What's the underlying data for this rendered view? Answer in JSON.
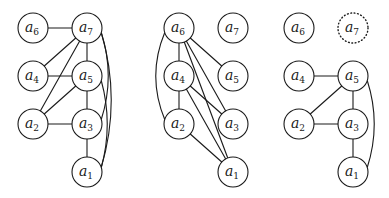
{
  "style": {
    "stroke": "#1a1a1a",
    "background": "#ffffff",
    "node_radius": 15
  },
  "panels": [
    {
      "name": "graph-left",
      "nodes": [
        {
          "id": "a6",
          "base": "a",
          "sub": "6",
          "x": 33,
          "y": 28,
          "dotted": false
        },
        {
          "id": "a7",
          "base": "a",
          "sub": "7",
          "x": 87,
          "y": 28,
          "dotted": false
        },
        {
          "id": "a4",
          "base": "a",
          "sub": "4",
          "x": 33,
          "y": 76,
          "dotted": false
        },
        {
          "id": "a5",
          "base": "a",
          "sub": "5",
          "x": 87,
          "y": 76,
          "dotted": false
        },
        {
          "id": "a2",
          "base": "a",
          "sub": "2",
          "x": 33,
          "y": 124,
          "dotted": false
        },
        {
          "id": "a3",
          "base": "a",
          "sub": "3",
          "x": 87,
          "y": 124,
          "dotted": false
        },
        {
          "id": "a1",
          "base": "a",
          "sub": "1",
          "x": 87,
          "y": 172,
          "dotted": false
        }
      ],
      "edges": [
        {
          "from": "a6",
          "to": "a7",
          "type": "straight"
        },
        {
          "from": "a4",
          "to": "a7",
          "type": "straight"
        },
        {
          "from": "a4",
          "to": "a5",
          "type": "straight"
        },
        {
          "from": "a2",
          "to": "a7",
          "type": "straight"
        },
        {
          "from": "a2",
          "to": "a5",
          "type": "straight"
        },
        {
          "from": "a2",
          "to": "a3",
          "type": "straight"
        },
        {
          "from": "a7",
          "to": "a5",
          "type": "straight"
        },
        {
          "from": "a5",
          "to": "a3",
          "type": "straight"
        },
        {
          "from": "a3",
          "to": "a1",
          "type": "straight"
        },
        {
          "from": "a7",
          "to": "a3",
          "type": "curve",
          "bulge": 14
        },
        {
          "from": "a7",
          "to": "a1",
          "type": "curve",
          "bulge": 20
        },
        {
          "from": "a5",
          "to": "a1",
          "type": "curve",
          "bulge": 12
        }
      ]
    },
    {
      "name": "graph-middle",
      "nodes": [
        {
          "id": "a6",
          "base": "a",
          "sub": "6",
          "x": 179,
          "y": 28,
          "dotted": false
        },
        {
          "id": "a7",
          "base": "a",
          "sub": "7",
          "x": 233,
          "y": 28,
          "dotted": false
        },
        {
          "id": "a4",
          "base": "a",
          "sub": "4",
          "x": 179,
          "y": 76,
          "dotted": false
        },
        {
          "id": "a5",
          "base": "a",
          "sub": "5",
          "x": 233,
          "y": 76,
          "dotted": false
        },
        {
          "id": "a2",
          "base": "a",
          "sub": "2",
          "x": 179,
          "y": 124,
          "dotted": false
        },
        {
          "id": "a3",
          "base": "a",
          "sub": "3",
          "x": 233,
          "y": 124,
          "dotted": false
        },
        {
          "id": "a1",
          "base": "a",
          "sub": "1",
          "x": 233,
          "y": 172,
          "dotted": false
        }
      ],
      "edges": [
        {
          "from": "a6",
          "to": "a4",
          "type": "straight"
        },
        {
          "from": "a4",
          "to": "a2",
          "type": "straight"
        },
        {
          "from": "a6",
          "to": "a2",
          "type": "curve",
          "bulge": -18
        },
        {
          "from": "a6",
          "to": "a5",
          "type": "straight"
        },
        {
          "from": "a6",
          "to": "a3",
          "type": "straight"
        },
        {
          "from": "a6",
          "to": "a1",
          "type": "straight"
        },
        {
          "from": "a4",
          "to": "a3",
          "type": "straight"
        },
        {
          "from": "a4",
          "to": "a1",
          "type": "straight"
        },
        {
          "from": "a2",
          "to": "a1",
          "type": "straight"
        }
      ]
    },
    {
      "name": "graph-right",
      "nodes": [
        {
          "id": "a6",
          "base": "a",
          "sub": "6",
          "x": 299,
          "y": 28,
          "dotted": false
        },
        {
          "id": "a7",
          "base": "a",
          "sub": "7",
          "x": 353,
          "y": 28,
          "dotted": true
        },
        {
          "id": "a4",
          "base": "a",
          "sub": "4",
          "x": 299,
          "y": 76,
          "dotted": false
        },
        {
          "id": "a5",
          "base": "a",
          "sub": "5",
          "x": 353,
          "y": 76,
          "dotted": false
        },
        {
          "id": "a2",
          "base": "a",
          "sub": "2",
          "x": 299,
          "y": 124,
          "dotted": false
        },
        {
          "id": "a3",
          "base": "a",
          "sub": "3",
          "x": 353,
          "y": 124,
          "dotted": false
        },
        {
          "id": "a1",
          "base": "a",
          "sub": "1",
          "x": 353,
          "y": 172,
          "dotted": false
        }
      ],
      "edges": [
        {
          "from": "a4",
          "to": "a5",
          "type": "straight"
        },
        {
          "from": "a2",
          "to": "a5",
          "type": "straight"
        },
        {
          "from": "a2",
          "to": "a3",
          "type": "straight"
        },
        {
          "from": "a5",
          "to": "a3",
          "type": "straight"
        },
        {
          "from": "a3",
          "to": "a1",
          "type": "straight"
        },
        {
          "from": "a5",
          "to": "a1",
          "type": "curve",
          "bulge": 14
        }
      ]
    }
  ]
}
